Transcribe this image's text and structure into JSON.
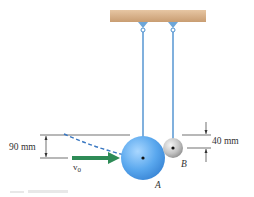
{
  "diagram": {
    "type": "physics-figure",
    "labels": {
      "dim_left": "90 mm",
      "dim_right": "40 mm",
      "velocity": "v",
      "velocity_sub": "0",
      "sphere_a": "A",
      "sphere_b": "B"
    },
    "colors": {
      "ceiling": "#d9b28c",
      "rope": "#4a8fcf",
      "sphere_a": "#5aa8ee",
      "sphere_b": "#bfbfbf",
      "arrow": "#2e8b57",
      "trajectory": "#3a78c2",
      "dim_lines": "#333333"
    }
  }
}
